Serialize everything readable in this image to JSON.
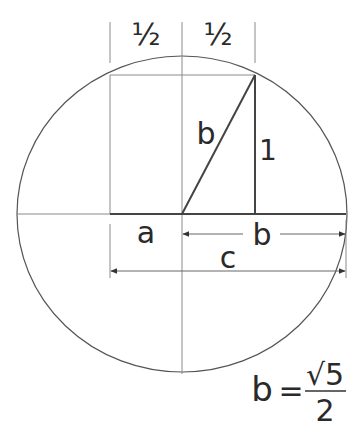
{
  "diagram": {
    "colors": {
      "stroke": "#555555",
      "thin": "#8a8a8a",
      "text": "#2a2a2a",
      "background": "#ffffff"
    },
    "labels": {
      "half_left": "½",
      "half_right": "½",
      "hyp_b": "b",
      "side_1": "1",
      "seg_a": "a",
      "seg_b": "b",
      "seg_c": "c"
    },
    "formula": {
      "lhs": "b",
      "equals": "=",
      "numerator": "√5",
      "denominator": "2"
    }
  }
}
